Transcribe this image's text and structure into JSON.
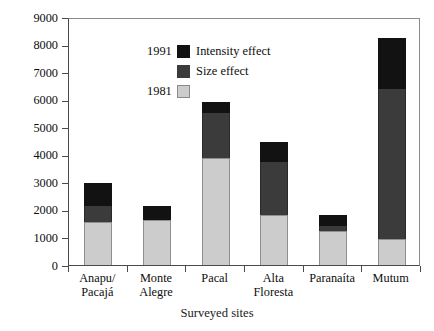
{
  "chart_data": {
    "type": "bar",
    "stacked": true,
    "title": "",
    "xlabel": "Surveyed sites",
    "ylabel": "Hectares",
    "ylim": [
      0,
      9000
    ],
    "ytick_labels": [
      "9000",
      "8000",
      "7000",
      "6000",
      "5000",
      "4000",
      "3000",
      "2000",
      "1000",
      "0"
    ],
    "ytick_values": [
      9000,
      8000,
      7000,
      6000,
      5000,
      4000,
      3000,
      2000,
      1000,
      0
    ],
    "grid": false,
    "legend_position": "top-left",
    "categories": [
      "Anapu/ Pacajá",
      "Monte Alegre",
      "Pacal",
      "Alta Floresta",
      "Paranaíta",
      "Mutum"
    ],
    "category_lines": [
      [
        "Anapu/",
        "Pacajá"
      ],
      [
        "Monte",
        "Alegre"
      ],
      [
        "Pacal",
        ""
      ],
      [
        "Alta",
        "Floresta"
      ],
      [
        "Paranaíta",
        ""
      ],
      [
        "Mutum",
        ""
      ]
    ],
    "series": [
      {
        "name": "1981",
        "legend_year": "1981",
        "color": "#cccccc",
        "values": [
          1550,
          1650,
          3900,
          1800,
          1230,
          950
        ]
      },
      {
        "name": "Size effect",
        "legend_year": "1991",
        "color": "#3b3b3b",
        "values": [
          600,
          0,
          1600,
          1950,
          170,
          5450
        ]
      },
      {
        "name": "Intensity effect",
        "legend_year": "1991",
        "color": "#121212",
        "values": [
          840,
          500,
          400,
          700,
          430,
          1850
        ]
      }
    ],
    "totals": [
      2990,
      2150,
      5900,
      4450,
      1830,
      8250
    ],
    "cumulative_boundaries": [
      [
        1550,
        2150,
        2990
      ],
      [
        1650,
        1650,
        2150
      ],
      [
        3900,
        5500,
        5900
      ],
      [
        1800,
        3750,
        4450
      ],
      [
        1230,
        1400,
        1830
      ],
      [
        950,
        6400,
        8250
      ]
    ]
  },
  "legend": {
    "rows": [
      {
        "year": "1991",
        "swatch": "intensity",
        "label": "Intensity effect"
      },
      {
        "year": "",
        "swatch": "size",
        "label": "Size effect"
      },
      {
        "year": "1981",
        "swatch": "base",
        "label": ""
      }
    ]
  },
  "colors": {
    "intensity_effect": "#121212",
    "size_effect": "#3b3b3b",
    "base_1981": "#cccccc",
    "axis": "#4a4a4a",
    "background": "#ffffff"
  }
}
